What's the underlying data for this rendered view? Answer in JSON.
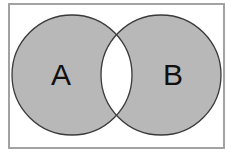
{
  "figure": {
    "kind": "venn-diagram",
    "canvas": {
      "width": 233,
      "height": 157,
      "background": "#ffffff"
    }
  },
  "frame": {
    "outer_margin_color": "#ffffff",
    "border_color": "#a2a2a2",
    "border_width": 2,
    "interior_color": "#ffffff",
    "x": 9,
    "y": 4,
    "width": 215,
    "height": 144
  },
  "colors": {
    "shaded_fill": "#b8b8b8",
    "unshaded_fill": "#ffffff",
    "outline": "#3a3a3a",
    "label_color": "#101010"
  },
  "sets": [
    {
      "id": "set-a",
      "label": "A",
      "label_x": 61,
      "label_y": 77,
      "circle": {
        "cx": 72,
        "cy": 75,
        "r": 60
      },
      "fill": "#b8b8b8"
    },
    {
      "id": "set-b",
      "label": "B",
      "label_x": 173,
      "label_y": 77,
      "circle": {
        "cx": 161,
        "cy": 75,
        "r": 60
      },
      "fill": "#b8b8b8"
    }
  ],
  "regions": {
    "a_only": {
      "name": "A only",
      "shaded": true,
      "fill": "#b8b8b8"
    },
    "b_only": {
      "name": "B only",
      "shaded": true,
      "fill": "#b8b8b8"
    },
    "intersection": {
      "name": "A and B",
      "shaded": false,
      "fill": "#ffffff"
    }
  },
  "outline": {
    "stroke": "#3a3a3a",
    "stroke_width": 1.3
  }
}
